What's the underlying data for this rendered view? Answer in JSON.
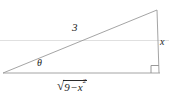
{
  "figure": {
    "type": "right-triangle-diagram",
    "background_color": "#ffffff",
    "stroke_color": "#9a9a9a",
    "text_color": "#1d1d1d",
    "labels": {
      "hypotenuse": "3",
      "angle": "θ",
      "opposite_side": "x",
      "adjacent_radical_sign": "√",
      "adjacent_radicand_number": "9",
      "adjacent_radicand_operator": "−",
      "adjacent_radicand_variable": "x",
      "adjacent_radicand_exponent": "2",
      "adjacent_full": "√(9 − x²)"
    },
    "geometry": {
      "left_vertex": [
        3,
        73
      ],
      "bottom_right_vertex": [
        160,
        73
      ],
      "top_right_vertex": [
        157,
        10
      ],
      "right_angle_marker": true,
      "right_angle_marker_size": 8,
      "baseline_artifact_y": 40
    }
  }
}
